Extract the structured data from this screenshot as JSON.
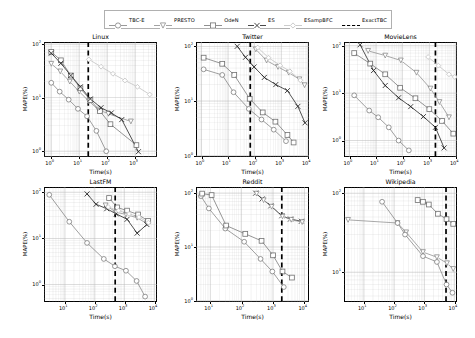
{
  "figure": {
    "xlabel": "Time(s)",
    "ylabel": "MAPE(%)",
    "tick_labels": {
      "e0": "10",
      "e1": "10",
      "e2": "10",
      "e3": "10",
      "e4": "10",
      "exp0": "0",
      "exp1": "1",
      "exp2": "2",
      "exp3": "3",
      "exp4": "4"
    }
  },
  "legend": {
    "entries": [
      {
        "label": "TBC-E",
        "marker": "circle",
        "color": "#808080"
      },
      {
        "label": "PRESTO",
        "marker": "triangle-down",
        "color": "#8c8c8c"
      },
      {
        "label": "OdeN",
        "marker": "square",
        "color": "#737373"
      },
      {
        "label": "ES",
        "marker": "x",
        "color": "#1a1a1a"
      },
      {
        "label": "ESampBFC",
        "marker": "diamond",
        "color": "#bfbfbf"
      },
      {
        "label": "ExactTBC",
        "marker": "dashed-line",
        "color": "#000000"
      }
    ]
  },
  "chart_data": [
    {
      "type": "line",
      "title": "Linux",
      "xlabel": "Time(s)",
      "ylabel": "MAPE(%)",
      "xscale": "log",
      "yscale": "log",
      "xlim": [
        0.55,
        6000
      ],
      "ylim": [
        0.78,
        110
      ],
      "xticks": [
        1,
        10,
        100,
        1000
      ],
      "yticks": [
        1,
        10,
        100
      ],
      "grid": true,
      "vline": {
        "name": "ExactTBC",
        "x": 21
      },
      "series": [
        {
          "name": "TBC-E",
          "marker": "circle",
          "color": "#808080",
          "x": [
            1.0,
            2.0,
            4.2,
            9.0,
            19.0,
            41.0,
            92.0
          ],
          "y": [
            19.0,
            13.0,
            9.2,
            6.2,
            4.5,
            2.4,
            1.0
          ]
        },
        {
          "name": "PRESTO",
          "marker": "triangle-down",
          "color": "#8c8c8c",
          "x": [
            1.0,
            2.1,
            4.6,
            10.0,
            22.0,
            48.0,
            110.0,
            700.0
          ],
          "y": [
            43.0,
            31.0,
            20.0,
            13.0,
            8.6,
            6.0,
            5.0,
            3.6
          ]
        },
        {
          "name": "OdeN",
          "marker": "square",
          "color": "#737373",
          "x": [
            1.0,
            2.2,
            5.0,
            11.0,
            25.0,
            55.0,
            130.0,
            1100.0
          ],
          "y": [
            72.0,
            50.0,
            26.0,
            15.0,
            9.0,
            5.6,
            3.2,
            1.3
          ]
        },
        {
          "name": "ES",
          "marker": "x",
          "color": "#1a1a1a",
          "x": [
            1.0,
            2.2,
            5.0,
            11.0,
            25.0,
            60.0,
            140.0,
            330.0,
            1300.0
          ],
          "y": [
            68.0,
            44.0,
            26.0,
            16.0,
            9.5,
            6.5,
            5.2,
            3.9,
            0.98
          ]
        },
        {
          "name": "ESampBFC",
          "marker": "diamond",
          "color": "#bfbfbf",
          "x": [
            22.0,
            60.0,
            160.0,
            430.0,
            1200.0,
            3300.0
          ],
          "y": [
            52.0,
            38.0,
            28.0,
            21.0,
            16.0,
            11.5
          ]
        }
      ]
    },
    {
      "type": "line",
      "title": "Twitter",
      "xlabel": "Time(s)",
      "ylabel": "MAPE(%)",
      "xscale": "log",
      "yscale": "log",
      "xlim": [
        0.62,
        11000
      ],
      "ylim": [
        0.95,
        120
      ],
      "xticks": [
        1,
        10,
        100,
        1000,
        10000
      ],
      "yticks": [
        1,
        10,
        100
      ],
      "grid": true,
      "vline": {
        "name": "ExactTBC",
        "x": 68
      },
      "series": [
        {
          "name": "TBC-E",
          "marker": "circle",
          "color": "#808080",
          "x": [
            1.2,
            6.0,
            16.0,
            60.0,
            180.0,
            520.0,
            1500.0
          ],
          "y": [
            38.0,
            30.0,
            14.5,
            7.2,
            4.6,
            3.0,
            1.85
          ]
        },
        {
          "name": "PRESTO",
          "marker": "triangle-down",
          "color": "#8c8c8c",
          "x": [
            110.0,
            280.0,
            750.0,
            1900.0,
            4800.0,
            7500.0
          ],
          "y": [
            88.0,
            55.0,
            42.0,
            33.0,
            25.0,
            19.5
          ]
        },
        {
          "name": "OdeN",
          "marker": "square",
          "color": "#737373",
          "x": [
            1.2,
            6.0,
            17.0,
            65.0,
            200.0,
            600.0,
            1700.0,
            2900.0
          ],
          "y": [
            62.0,
            48.0,
            30.0,
            11.0,
            6.2,
            4.2,
            2.4,
            1.75
          ]
        },
        {
          "name": "ES",
          "marker": "x",
          "color": "#1a1a1a",
          "x": [
            22.0,
            45.0,
            95.0,
            230.0,
            620.0,
            1700.0,
            4200.0,
            7800.0
          ],
          "y": [
            100.0,
            63.0,
            42.0,
            27.0,
            20.0,
            15.5,
            8.0,
            4.0
          ]
        },
        {
          "name": "ESampBFC",
          "marker": "diamond",
          "color": "#bfbfbf",
          "x": [
            130.0,
            330.0,
            900.0,
            2100.0,
            5200.0
          ],
          "y": [
            95.0,
            62.0,
            45.0,
            35.0,
            24.0
          ]
        }
      ]
    },
    {
      "type": "line",
      "title": "MovieLens",
      "xlabel": "Time(s)",
      "ylabel": "MAPE(%)",
      "xscale": "log",
      "yscale": "log",
      "xlim": [
        0.62,
        11000
      ],
      "ylim": [
        0.45,
        120
      ],
      "xticks": [
        1,
        10,
        100,
        1000,
        10000
      ],
      "yticks": [
        1,
        10,
        100
      ],
      "grid": true,
      "vline": {
        "name": "ExactTBC",
        "x": 1700
      },
      "series": [
        {
          "name": "TBC-E",
          "marker": "circle",
          "color": "#808080",
          "x": [
            1.5,
            5.5,
            12.0,
            30.0,
            70.0,
            170.0
          ],
          "y": [
            9.0,
            4.3,
            3.1,
            1.9,
            1.0,
            0.62
          ]
        },
        {
          "name": "PRESTO",
          "marker": "triangle-down",
          "color": "#8c8c8c",
          "x": [
            5.0,
            22.0,
            85.0,
            330.0,
            1100.0,
            2400.0,
            5500.0
          ],
          "y": [
            78.0,
            62.0,
            49.0,
            27.0,
            12.5,
            6.5,
            3.1
          ]
        },
        {
          "name": "OdeN",
          "marker": "square",
          "color": "#737373",
          "x": [
            1.5,
            6.0,
            22.0,
            80.0,
            300.0,
            1000.0,
            3000.0,
            8000.0
          ],
          "y": [
            70.0,
            42.0,
            25.0,
            13.0,
            7.8,
            4.6,
            2.6,
            1.4
          ]
        },
        {
          "name": "ES",
          "marker": "x",
          "color": "#1a1a1a",
          "x": [
            2.5,
            8.0,
            22.0,
            70.0,
            200.0,
            600.0,
            1700.0,
            3600.0
          ],
          "y": [
            105.0,
            30.0,
            14.5,
            8.0,
            5.2,
            3.2,
            1.9,
            0.7
          ]
        },
        {
          "name": "ESampBFC",
          "marker": "diamond",
          "color": "#bfbfbf",
          "x": [
            900.0,
            2200.0,
            5500.0,
            9000.0
          ],
          "y": [
            58.0,
            38.0,
            25.0,
            22.0
          ]
        }
      ]
    },
    {
      "type": "line",
      "title": "LastFM",
      "xlabel": "Time(s)",
      "ylabel": "MAPE(%)",
      "xscale": "log",
      "yscale": "log",
      "xlim": [
        2.0,
        12000
      ],
      "ylim": [
        0.42,
        130
      ],
      "xticks": [
        10,
        100,
        1000,
        10000
      ],
      "yticks": [
        1,
        10,
        100
      ],
      "grid": true,
      "vline": {
        "name": "ExactTBC",
        "x": 480
      },
      "series": [
        {
          "name": "TBC-E",
          "marker": "circle",
          "color": "#808080",
          "x": [
            3.0,
            14.0,
            55.0,
            200.0,
            470.0,
            1100.0,
            2500.0,
            4800.0
          ],
          "y": [
            88.0,
            23.0,
            8.0,
            3.6,
            2.5,
            2.0,
            1.2,
            0.55
          ]
        },
        {
          "name": "PRESTO",
          "marker": "triangle-down",
          "color": "#8c8c8c",
          "x": [
            230.0,
            520.0,
            1100.0,
            2600.0,
            5500.0
          ],
          "y": [
            52.0,
            37.0,
            33.0,
            28.0,
            21.0
          ]
        },
        {
          "name": "OdeN",
          "marker": "square",
          "color": "#737373",
          "x": [
            300.0,
            560.0,
            1200.0,
            2800.0,
            6000.0
          ],
          "y": [
            75.0,
            47.0,
            40.0,
            33.0,
            24.0
          ]
        },
        {
          "name": "ES",
          "marker": "x",
          "color": "#1a1a1a",
          "x": [
            55.0,
            110.0,
            250.0,
            520.0,
            1200.0,
            2600.0,
            5500.0
          ],
          "y": [
            92.0,
            55.0,
            44.0,
            34.0,
            26.0,
            13.0,
            20.0
          ]
        },
        {
          "name": "ESampBFC",
          "marker": "diamond",
          "color": "#bfbfbf",
          "x": [
            280.0,
            620.0,
            1400.0,
            3000.0,
            6200.0
          ],
          "y": [
            48.0,
            40.0,
            34.0,
            29.0,
            22.0
          ]
        }
      ]
    },
    {
      "type": "line",
      "title": "Reddit",
      "xlabel": "Time(s)",
      "ylabel": "MAPE(%)",
      "xscale": "log",
      "yscale": "log",
      "xlim": [
        3.5,
        14000
      ],
      "ylim": [
        0.95,
        130
      ],
      "xticks": [
        10,
        100,
        1000,
        10000
      ],
      "yticks": [
        1,
        10,
        100
      ],
      "grid": true,
      "vline": {
        "name": "ExactTBC",
        "x": 1900
      },
      "series": [
        {
          "name": "TBC-E",
          "marker": "circle",
          "color": "#808080",
          "x": [
            5.0,
            9.0,
            30.0,
            120.0,
            400.0,
            950.0,
            2200.0
          ],
          "y": [
            88.0,
            52.0,
            22.0,
            12.5,
            6.0,
            3.5,
            1.8
          ]
        },
        {
          "name": "OdeN",
          "marker": "square",
          "color": "#737373",
          "x": [
            5.5,
            11.0,
            32.0,
            130.0,
            430.0,
            1000.0,
            2000.0,
            4000.0
          ],
          "y": [
            98.0,
            92.0,
            25.0,
            17.5,
            13.0,
            7.0,
            3.5,
            2.7
          ]
        },
        {
          "name": "ES",
          "marker": "x",
          "color": "#1a1a1a",
          "x": [
            280.0,
            450.0,
            850.0,
            1900.0,
            3600.0,
            8000.0
          ],
          "y": [
            100.0,
            78.0,
            58.0,
            38.0,
            33.0,
            30.0
          ]
        },
        {
          "name": "PRESTO",
          "marker": "triangle-down",
          "color": "#8c8c8c",
          "x": [
            300.0,
            500.0,
            900.0,
            2000.0,
            3800.0,
            8500.0
          ],
          "y": [
            98.0,
            74.0,
            56.0,
            37.0,
            32.0,
            29.0
          ]
        }
      ]
    },
    {
      "type": "line",
      "title": "Wikipedia",
      "xlabel": "Time(s)",
      "ylabel": "MAPE(%)",
      "xscale": "log",
      "yscale": "log",
      "xlim": [
        2.2,
        12000
      ],
      "ylim": [
        4.2,
        120
      ],
      "xticks": [
        10,
        100,
        1000,
        10000
      ],
      "yticks": [
        10,
        100
      ],
      "grid": true,
      "vline": {
        "name": "ExactTBC",
        "x": 5200
      },
      "series": [
        {
          "name": "PRESTO",
          "marker": "triangle-down",
          "color": "#8c8c8c",
          "x": [
            3.0,
            130.0,
            250.0,
            900.0,
            2600.0,
            5600.0,
            9000.0
          ],
          "y": [
            46.0,
            42.0,
            32.0,
            18.0,
            15.5,
            13.0,
            11.0
          ]
        },
        {
          "name": "TBC-E",
          "marker": "circle",
          "color": "#808080",
          "x": [
            40.0,
            130.0,
            230.0,
            900.0,
            2600.0,
            5400.0,
            8500.0
          ],
          "y": [
            78.0,
            42.0,
            30.0,
            16.0,
            13.5,
            7.0,
            5.5
          ]
        },
        {
          "name": "OdeN",
          "marker": "square",
          "color": "#737373",
          "x": [
            600.0,
            900.0,
            1400.0,
            2800.0,
            5400.0,
            9000.0
          ],
          "y": [
            82.0,
            78.0,
            72.0,
            55.0,
            47.0,
            41.0
          ]
        }
      ]
    }
  ]
}
